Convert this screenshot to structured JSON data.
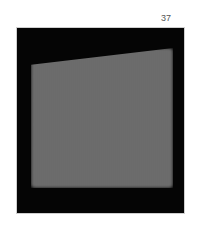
{
  "page": {
    "number": "37"
  },
  "figure": {
    "colors": {
      "background": "#050505",
      "region": "#6b6b6b",
      "frame": "#cfcfcf"
    }
  }
}
